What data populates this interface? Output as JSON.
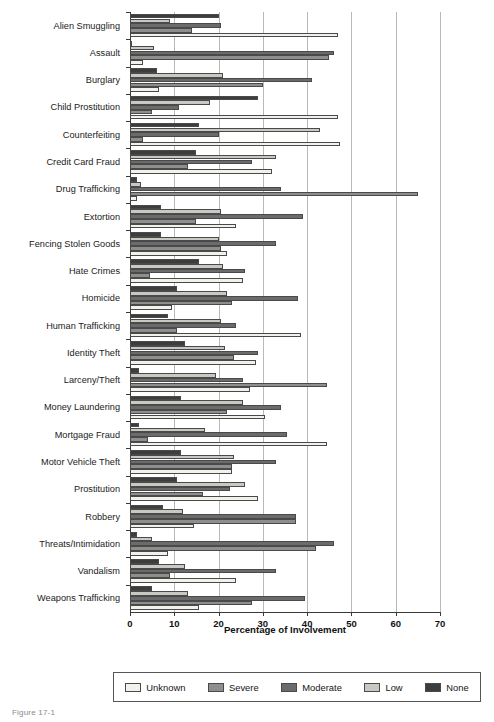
{
  "chart_data": {
    "type": "bar",
    "orientation": "horizontal",
    "title": "",
    "xlabel": "Percentage of Involvement",
    "ylabel": "",
    "xlim": [
      0,
      70
    ],
    "xticks": [
      0,
      10,
      20,
      30,
      40,
      50,
      60,
      70
    ],
    "grid": true,
    "legend_position": "bottom",
    "categories": [
      "Alien Smuggling",
      "Assault",
      "Burglary",
      "Child Prostitution",
      "Counterfeiting",
      "Credit Card Fraud",
      "Drug Trafficking",
      "Extortion",
      "Fencing Stolen Goods",
      "Hate Crimes",
      "Homicide",
      "Human Trafficking",
      "Identity Theft",
      "Larceny/Theft",
      "Money Laundering",
      "Mortgage Fraud",
      "Motor Vehicle Theft",
      "Prostitution",
      "Robbery",
      "Threats/Intimidation",
      "Vandalism",
      "Weapons Trafficking"
    ],
    "series": [
      {
        "name": "Unknown",
        "color": "#f2f1ec",
        "values": [
          47.0,
          3.0,
          6.5,
          47.0,
          47.5,
          32.0,
          1.5,
          24.0,
          22.0,
          25.5,
          9.5,
          38.5,
          28.5,
          27.0,
          30.5,
          44.5,
          23.0,
          29.0,
          14.5,
          8.5,
          24.0,
          15.5
        ]
      },
      {
        "name": "Severe",
        "color": "#8e8e8e",
        "values": [
          14.0,
          45.0,
          30.0,
          5.0,
          3.0,
          13.0,
          65.0,
          15.0,
          20.5,
          4.5,
          23.0,
          10.5,
          23.5,
          44.5,
          22.0,
          4.0,
          23.0,
          16.5,
          37.5,
          42.0,
          9.0,
          27.5
        ]
      },
      {
        "name": "Moderate",
        "color": "#6b6b6b",
        "values": [
          20.5,
          46.0,
          41.0,
          11.0,
          20.0,
          27.5,
          34.0,
          39.0,
          33.0,
          26.0,
          38.0,
          24.0,
          29.0,
          25.5,
          34.0,
          35.5,
          33.0,
          22.5,
          37.5,
          46.0,
          33.0,
          39.5
        ]
      },
      {
        "name": "Low",
        "color": "#c9c9c4",
        "values": [
          9.0,
          5.5,
          21.0,
          18.0,
          43.0,
          33.0,
          2.5,
          20.5,
          20.0,
          21.0,
          22.0,
          20.5,
          21.5,
          19.5,
          25.5,
          17.0,
          23.5,
          26.0,
          12.0,
          5.0,
          12.5,
          13.0
        ]
      },
      {
        "name": "None",
        "color": "#3d3d3d",
        "values": [
          20.0,
          0.5,
          6.0,
          29.0,
          15.5,
          15.0,
          1.5,
          7.0,
          7.0,
          15.5,
          10.5,
          8.5,
          12.5,
          2.0,
          11.5,
          2.0,
          11.5,
          10.5,
          7.5,
          1.5,
          6.5,
          5.0
        ]
      }
    ]
  },
  "legend": {
    "items": [
      {
        "label": "Unknown"
      },
      {
        "label": "Severe"
      },
      {
        "label": "Moderate"
      },
      {
        "label": "Low"
      },
      {
        "label": "None"
      }
    ]
  },
  "caption": "Figure 17-1"
}
